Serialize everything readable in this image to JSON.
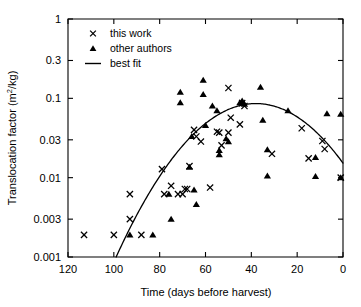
{
  "chart_data": {
    "type": "scatter",
    "title": "",
    "xlabel": "Time (days before harvest)",
    "ylabel": "Translocation factor (m2/kg)",
    "ylabel_base": "Translocation factor (m",
    "ylabel_sup": "2",
    "ylabel_tail": "/kg)",
    "xscale": "linear",
    "yscale": "log",
    "xlim": [
      120,
      0
    ],
    "ylim": [
      0.001,
      1
    ],
    "x_reversed": true,
    "grid": false,
    "legend_position": "top-left-inside",
    "xticks": [
      120,
      100,
      80,
      60,
      40,
      20,
      0
    ],
    "xticklabels": [
      "120",
      "100",
      "80",
      "60",
      "40",
      "20",
      "0"
    ],
    "yticks": [
      0.001,
      0.003,
      0.01,
      0.03,
      0.1,
      0.3,
      1
    ],
    "yticklabels": [
      "0.001",
      "0.003",
      "0.01",
      "0.03",
      "0.1",
      "0.3",
      "1"
    ],
    "legend": [
      {
        "label": "this work",
        "marker": "x"
      },
      {
        "label": "other authors",
        "marker": "triangle"
      },
      {
        "label": "best fit",
        "marker": "line"
      }
    ],
    "series": [
      {
        "name": "this work",
        "marker": "x",
        "points": [
          [
            113,
            0.0019
          ],
          [
            100,
            0.0019
          ],
          [
            93,
            0.0062
          ],
          [
            93,
            0.003
          ],
          [
            88,
            0.0019
          ],
          [
            79,
            0.0128
          ],
          [
            78,
            0.0062
          ],
          [
            75,
            0.0079
          ],
          [
            72,
            0.0062
          ],
          [
            70,
            0.0062
          ],
          [
            69,
            0.0072
          ],
          [
            68,
            0.0072
          ],
          [
            67,
            0.014
          ],
          [
            65,
            0.04
          ],
          [
            64,
            0.033
          ],
          [
            62,
            0.0285
          ],
          [
            58,
            0.0075
          ],
          [
            55,
            0.038
          ],
          [
            54,
            0.037
          ],
          [
            53,
            0.0255
          ],
          [
            50,
            0.135
          ],
          [
            50,
            0.037
          ],
          [
            49,
            0.057
          ],
          [
            45,
            0.047
          ],
          [
            44,
            0.087
          ],
          [
            43,
            0.08
          ],
          [
            31,
            0.02
          ],
          [
            18,
            0.042
          ],
          [
            15,
            0.0175
          ],
          [
            9,
            0.029
          ],
          [
            8,
            0.023
          ],
          [
            1,
            0.01
          ]
        ]
      },
      {
        "name": "other authors",
        "marker": "triangle",
        "points": [
          [
            93,
            0.0019
          ],
          [
            83,
            0.0019
          ],
          [
            76,
            0.0062
          ],
          [
            75,
            0.003
          ],
          [
            71,
            0.12
          ],
          [
            71,
            0.088
          ],
          [
            67,
            0.0136
          ],
          [
            66,
            0.033
          ],
          [
            65,
            0.007
          ],
          [
            64,
            0.0046
          ],
          [
            61,
            0.17
          ],
          [
            61,
            0.112
          ],
          [
            60,
            0.0455
          ],
          [
            57,
            0.08
          ],
          [
            55,
            0.07
          ],
          [
            54,
            0.022
          ],
          [
            54,
            0.0195
          ],
          [
            51,
            0.031
          ],
          [
            50,
            0.0285
          ],
          [
            45,
            0.088
          ],
          [
            44,
            0.093
          ],
          [
            43,
            0.0845
          ],
          [
            36,
            0.138
          ],
          [
            35,
            0.053
          ],
          [
            33,
            0.0225
          ],
          [
            33,
            0.0105
          ],
          [
            24,
            0.07
          ],
          [
            12,
            0.018
          ],
          [
            12,
            0.0104
          ],
          [
            7,
            0.064
          ],
          [
            1,
            0.063
          ],
          [
            1,
            0.01
          ]
        ]
      }
    ],
    "fit": {
      "name": "best fit",
      "description": "inverted parabola in log space, peaks near 38 days before harvest",
      "peak_x": 38,
      "peak_y": 0.086,
      "x_start": 99,
      "y_start": 0.001,
      "x_end": 0,
      "y_end": 0.0175
    }
  }
}
